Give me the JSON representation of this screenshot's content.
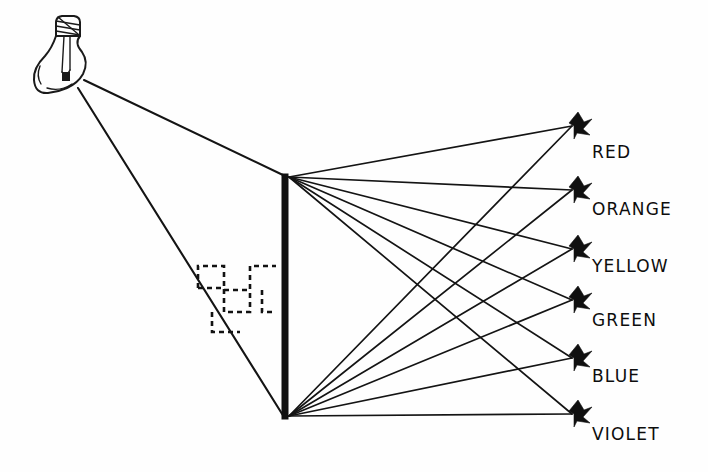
{
  "figure": {
    "background_color": "#fefefe",
    "ink_color": "#141414",
    "width": 708,
    "height": 472
  },
  "source": {
    "name": "light-bulb",
    "label": "",
    "x": 82,
    "y": 82,
    "description": "incandescent light bulb emitting white light"
  },
  "barrier": {
    "name": "slit-barrier",
    "x": 285,
    "top_y": 175,
    "bottom_y": 418,
    "thickness": 6,
    "color": "#111111"
  },
  "incident_rays": [
    {
      "name": "incident-ray-upper",
      "x1": 84,
      "y1": 80,
      "x2": 285,
      "y2": 176
    },
    {
      "name": "incident-ray-lower",
      "x1": 78,
      "y1": 88,
      "x2": 284,
      "y2": 417
    }
  ],
  "wave_marker": {
    "name": "wave-dashed-marker",
    "description": "dashed square-wave symbol crossing the lower incident ray",
    "x": 196,
    "y": 262,
    "width": 82,
    "height": 76
  },
  "spectrum": {
    "fan_origin_top": {
      "x": 287,
      "y": 176
    },
    "fan_origin_bottom": {
      "x": 287,
      "y": 417
    },
    "arrow_x": 578,
    "label_x": 592,
    "colors": [
      {
        "label": "RED",
        "arrow_y": 126,
        "label_y": 158,
        "accent": "#d62020"
      },
      {
        "label": "ORANGE",
        "arrow_y": 190,
        "label_y": 215,
        "accent": "#e8801a"
      },
      {
        "label": "YELLOW",
        "arrow_y": 249,
        "label_y": 272,
        "accent": "#e8d21a"
      },
      {
        "label": "GREEN",
        "arrow_y": 300,
        "label_y": 326,
        "accent": "#2aa832"
      },
      {
        "label": "BLUE",
        "arrow_y": 358,
        "label_y": 382,
        "accent": "#2040d0"
      },
      {
        "label": "VIOLET",
        "arrow_y": 414,
        "label_y": 440,
        "accent": "#7a28c0"
      }
    ]
  }
}
